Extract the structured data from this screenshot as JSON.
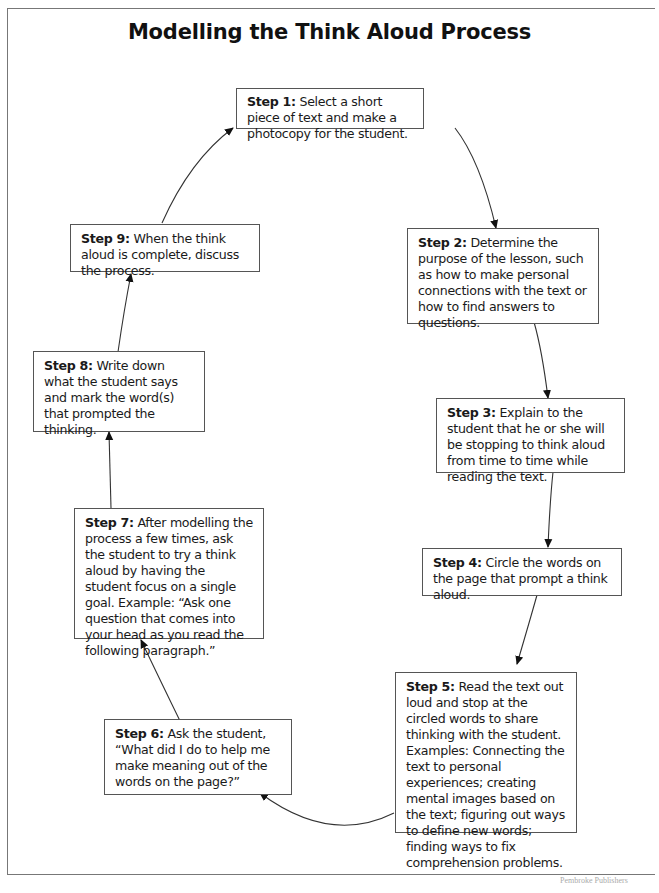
{
  "title": "Modelling the Think Aloud Process",
  "steps": [
    {
      "label": "Step 1:",
      "text": " Select a short piece of text and make a photocopy for the student."
    },
    {
      "label": "Step 2:",
      "text": " Determine the purpose of the lesson, such as how to make personal connections with the text or how to find answers to questions."
    },
    {
      "label": "Step 3:",
      "text": " Explain to the student that he or she will be stopping to think aloud from time to time while reading the text."
    },
    {
      "label": "Step 4:",
      "text": " Circle the words on the page that prompt a think aloud."
    },
    {
      "label": "Step 5:",
      "text": " Read the text out loud and stop at the circled words to share thinking with the student. Examples: Connecting the text to personal experiences; creating mental images based on the text; figuring out ways to define new words; finding ways to fix comprehension problems."
    },
    {
      "label": "Step 6:",
      "text": " Ask the student, “What did I do to help me make meaning out of the words on the page?”"
    },
    {
      "label": "Step 7:",
      "text": " After modelling the process a few times, ask the student to try a think aloud by having the student focus on a single goal.  Example: “Ask one question that comes into your head as you read the following paragraph.”"
    },
    {
      "label": "Step 8:",
      "text": " Write down what the student says and mark the word(s) that prompted the thinking."
    },
    {
      "label": "Step 9:",
      "text": " When the think aloud is complete, discuss the process."
    }
  ],
  "flow": [
    "Step 1 → Step 2",
    "Step 2 → Step 3",
    "Step 3 → Step 4",
    "Step 4 → Step 5",
    "Step 5 → Step 6",
    "Step 6 → Step 7",
    "Step 7 → Step 8",
    "Step 8 → Step 9",
    "Step 9 → Step 1"
  ],
  "footer": "Pembroke Publishers"
}
